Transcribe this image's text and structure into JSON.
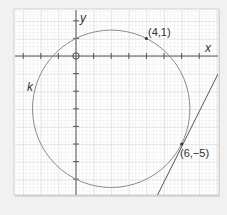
{
  "figure": {
    "axes": {
      "x_label": "x",
      "y_label": "y",
      "origin_marker": "O"
    },
    "circle": {
      "label": "k",
      "center": [
        2,
        -3
      ],
      "radius_squared": 20
    },
    "points": [
      {
        "label": "(4,1)",
        "x": 4,
        "y": 1
      },
      {
        "label": "(6,−5)",
        "x": 6,
        "y": -5
      }
    ],
    "tangent_line": {
      "slope": 2,
      "intercept": -17,
      "through": [
        6,
        -5
      ]
    },
    "colors": {
      "background": "#f1f1f1",
      "paper": "#ffffff",
      "minor_grid": "#d9d9d9",
      "major_grid": "#b5b5b5",
      "axis": "#555555",
      "curve": "#8c8c8c",
      "line": "#555555"
    }
  }
}
